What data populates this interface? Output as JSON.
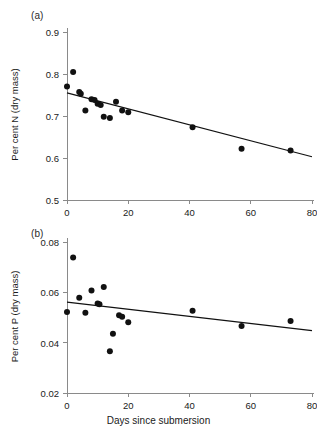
{
  "figure": {
    "xlabel": "Days since submersion"
  },
  "chart_data": [
    {
      "type": "scatter",
      "panel_label": "(a)",
      "title": "",
      "xlabel": "Days since submersion",
      "ylabel": "Per cent N (dry mass)",
      "xlim": [
        0,
        80
      ],
      "ylim": [
        0.5,
        0.9
      ],
      "xticks": [
        0,
        20,
        40,
        60,
        80
      ],
      "xticklabels": [
        "0",
        "20",
        "40",
        "60",
        "80"
      ],
      "yticks": [
        0.5,
        0.6,
        0.7,
        0.8,
        0.9
      ],
      "yticklabels": [
        "0.5",
        "0.6",
        "0.7",
        "0.8",
        "0.9"
      ],
      "grid": false,
      "legend": "none",
      "marker": "filled-circle",
      "points": [
        {
          "x": 0,
          "y": 0.77
        },
        {
          "x": 2,
          "y": 0.805
        },
        {
          "x": 4,
          "y": 0.757
        },
        {
          "x": 4.5,
          "y": 0.753
        },
        {
          "x": 6,
          "y": 0.713
        },
        {
          "x": 8,
          "y": 0.74
        },
        {
          "x": 9,
          "y": 0.738
        },
        {
          "x": 10,
          "y": 0.729
        },
        {
          "x": 11,
          "y": 0.726
        },
        {
          "x": 12,
          "y": 0.698
        },
        {
          "x": 14,
          "y": 0.695
        },
        {
          "x": 16,
          "y": 0.734
        },
        {
          "x": 18,
          "y": 0.713
        },
        {
          "x": 20,
          "y": 0.709
        },
        {
          "x": 41,
          "y": 0.673
        },
        {
          "x": 57,
          "y": 0.622
        },
        {
          "x": 73,
          "y": 0.618
        }
      ],
      "fit_line": {
        "x": [
          0,
          80
        ],
        "y": [
          0.755,
          0.603
        ]
      }
    },
    {
      "type": "scatter",
      "panel_label": "(b)",
      "title": "",
      "xlabel": "Days since submersion",
      "ylabel": "Per cent P (dry mass)",
      "xlim": [
        0,
        80
      ],
      "ylim": [
        0.02,
        0.08
      ],
      "xticks": [
        0,
        20,
        40,
        60,
        80
      ],
      "xticklabels": [
        "0",
        "20",
        "40",
        "60",
        "80"
      ],
      "yticks": [
        0.02,
        0.04,
        0.06,
        0.08
      ],
      "yticklabels": [
        "0.02",
        "0.04",
        "0.06",
        "0.08"
      ],
      "grid": false,
      "legend": "none",
      "marker": "filled-circle",
      "points": [
        {
          "x": 0,
          "y": 0.0522
        },
        {
          "x": 2,
          "y": 0.0738
        },
        {
          "x": 4,
          "y": 0.0578
        },
        {
          "x": 6,
          "y": 0.0519
        },
        {
          "x": 8,
          "y": 0.0607
        },
        {
          "x": 10,
          "y": 0.0556
        },
        {
          "x": 10.6,
          "y": 0.0553
        },
        {
          "x": 12,
          "y": 0.0621
        },
        {
          "x": 14,
          "y": 0.0366
        },
        {
          "x": 15,
          "y": 0.0435
        },
        {
          "x": 17,
          "y": 0.0509
        },
        {
          "x": 18,
          "y": 0.0503
        },
        {
          "x": 20,
          "y": 0.0481
        },
        {
          "x": 41,
          "y": 0.0527
        },
        {
          "x": 57,
          "y": 0.0466
        },
        {
          "x": 73,
          "y": 0.0486
        }
      ],
      "fit_line": {
        "x": [
          0,
          80
        ],
        "y": [
          0.0561,
          0.0448
        ]
      }
    }
  ]
}
